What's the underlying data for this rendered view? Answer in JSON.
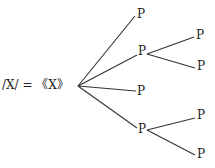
{
  "root": {
    "label": "/X/ = 《X》"
  },
  "nodes": {
    "n1": "P",
    "n2": "P",
    "n2a": "P",
    "n2b": "P",
    "n3": "P",
    "n4": "P",
    "n4a": "P",
    "n4b": "P"
  },
  "colors": {
    "line": "#333333",
    "text": "#222222"
  }
}
